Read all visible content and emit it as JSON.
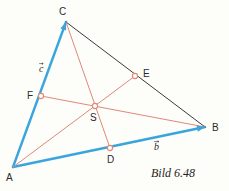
{
  "figure": {
    "caption": "Bild 6.48",
    "background_color": "#fdfdfa",
    "width": 229,
    "height": 191
  },
  "colors": {
    "side_blue": "#3aa5dc",
    "side_dark": "#3a3a3a",
    "median_red": "#e08878",
    "label_text": "#2b2b2b",
    "marker_fill": "#fdfdfa"
  },
  "geometry": {
    "type": "triangle-with-medians",
    "vertices": [
      {
        "name": "A",
        "x": 13,
        "y": 167
      },
      {
        "name": "B",
        "x": 205,
        "y": 127
      },
      {
        "name": "C",
        "x": 66,
        "y": 22
      }
    ],
    "midpoints": [
      {
        "name": "D",
        "on": "AB",
        "x": 110,
        "y": 148
      },
      {
        "name": "E",
        "on": "CB",
        "x": 135,
        "y": 76
      },
      {
        "name": "F",
        "on": "AC",
        "x": 41,
        "y": 96
      }
    ],
    "centroid": {
      "name": "S",
      "x": 95,
      "y": 106
    },
    "sides": [
      {
        "name": "AC",
        "from": "A",
        "to": "C",
        "color": "#3aa5dc",
        "width": 2.4,
        "style": "solid"
      },
      {
        "name": "AB",
        "from": "A",
        "to": "B",
        "color": "#3aa5dc",
        "width": 2.4,
        "style": "solid"
      },
      {
        "name": "CB",
        "from": "C",
        "to": "B",
        "color": "#3a3a3a",
        "width": 1.0,
        "style": "solid"
      }
    ],
    "medians": [
      {
        "name": "C-D",
        "from": "C",
        "to": "D",
        "color": "#e08878",
        "width": 1.0
      },
      {
        "name": "A-E",
        "from": "A",
        "to": "E",
        "color": "#e08878",
        "width": 1.0
      },
      {
        "name": "F-B",
        "from": "F",
        "to": "B",
        "color": "#e08878",
        "width": 1.0
      }
    ]
  },
  "labels": {
    "A": "A",
    "B": "B",
    "C": "C",
    "D": "D",
    "E": "E",
    "F": "F",
    "S": "S",
    "vector_c": "c",
    "vector_b": "b"
  }
}
